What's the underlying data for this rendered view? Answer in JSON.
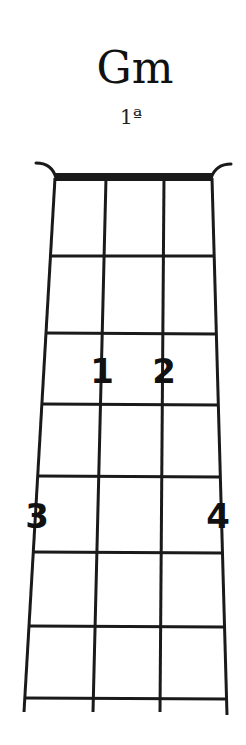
{
  "chord": {
    "name": "Gm",
    "position": "1ª"
  },
  "diagram": {
    "type": "ukulele-chord-chart",
    "strings": 4,
    "frets_shown": 7,
    "line_color": "#1a1a1a",
    "nut_color": "#1a1a1a",
    "fingers": [
      {
        "label": "1",
        "string": 2,
        "fret": 3
      },
      {
        "label": "2",
        "string": 3,
        "fret": 3
      },
      {
        "label": "3",
        "string": 1,
        "fret": 5
      },
      {
        "label": "4",
        "string": 4,
        "fret": 5
      }
    ]
  }
}
